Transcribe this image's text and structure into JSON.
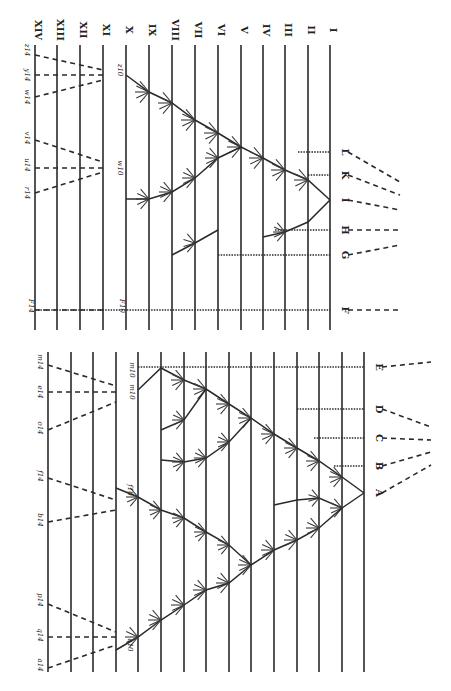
{
  "figure": {
    "ink_color": "#2a2a2a",
    "background": "#ffffff"
  },
  "upper_panel": {
    "line_x": [
      35,
      57,
      80,
      103,
      126,
      149,
      172,
      195,
      218,
      241,
      263,
      285,
      308,
      330
    ],
    "line_top": 45,
    "line_bottom": 330,
    "generation_labels": [
      "XIV",
      "XIII",
      "XII",
      "XI",
      "X",
      "IX",
      "VIII",
      "VII",
      "VI",
      "V",
      "IV",
      "III",
      "II",
      "I"
    ],
    "label_y": 30,
    "species": [
      {
        "label": "L",
        "y": 152
      },
      {
        "label": "K",
        "y": 175
      },
      {
        "label": "I",
        "y": 200
      },
      {
        "label": "H",
        "y": 230
      },
      {
        "label": "G",
        "y": 255
      },
      {
        "label": "F",
        "y": 310
      }
    ],
    "top_species": [
      "z14",
      "y14",
      "w14",
      "v14",
      "u14",
      "r14",
      "o14",
      "F14"
    ],
    "intermediate_labels": [
      "z10",
      "w10",
      "z9",
      "z8",
      "z7",
      "z6",
      "z5",
      "z4",
      "z3",
      "z2",
      "z1",
      "w9",
      "w8",
      "w7",
      "w6",
      "w5",
      "u8",
      "u7",
      "u6",
      "t3",
      "t2",
      "t1",
      "F10"
    ]
  },
  "lower_panel": {
    "line_x": [
      48,
      71,
      93,
      116,
      138,
      161,
      184,
      206,
      229,
      251,
      274,
      297,
      319,
      342,
      364
    ],
    "line_top": 352,
    "line_bottom": 672,
    "species": [
      {
        "label": "E",
        "y": 367
      },
      {
        "label": "D",
        "y": 409
      },
      {
        "label": "C",
        "y": 438
      },
      {
        "label": "B",
        "y": 466
      },
      {
        "label": "A",
        "y": 493
      }
    ],
    "top_species": [
      "m14",
      "e14",
      "o14",
      "f14",
      "b14",
      "p14",
      "q14",
      "a14"
    ],
    "intermediate_labels": [
      "m10",
      "m9",
      "m8",
      "m7",
      "m6",
      "m5",
      "m4",
      "m3",
      "m2",
      "m1",
      "l7",
      "l8",
      "k8",
      "k7",
      "k6",
      "k5",
      "i4",
      "i3",
      "i2",
      "i1",
      "f10",
      "f9",
      "f8",
      "f7",
      "f6",
      "f5",
      "f4",
      "f3",
      "a10",
      "a9",
      "a8",
      "a7",
      "a6",
      "a5",
      "a4",
      "a3",
      "a2",
      "a1",
      "E10"
    ]
  }
}
